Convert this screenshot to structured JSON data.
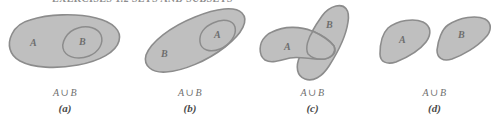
{
  "figure": {
    "heading_partial": "EXERCISES 1.2  SETS AND SUBSETS",
    "colors": {
      "blob_fill": "#bfbfbf",
      "blob_stroke": "#8c8c8c",
      "label_text": "#6e6e6e",
      "caption_text": "#6f6f6f",
      "index_text": "#4b4b4b",
      "background": "#ffffff"
    },
    "panels": [
      {
        "id": "a",
        "index_label": "(a)",
        "caption_expr": "A ∪ B",
        "caption_left": "A",
        "caption_op": "∪",
        "caption_right": "B",
        "relation": "B is a subset of A",
        "outer_set": "A",
        "inner_set": "B",
        "labels": [
          {
            "text": "A",
            "name": "set-label-a"
          },
          {
            "text": "B",
            "name": "set-label-b"
          }
        ]
      },
      {
        "id": "b",
        "index_label": "(b)",
        "caption_expr": "A ∪ B",
        "caption_left": "A",
        "caption_op": "∪",
        "caption_right": "B",
        "relation": "A is a subset of B",
        "outer_set": "B",
        "inner_set": "A",
        "labels": [
          {
            "text": "B",
            "name": "set-label-b"
          },
          {
            "text": "A",
            "name": "set-label-a"
          }
        ]
      },
      {
        "id": "c",
        "index_label": "(c)",
        "caption_expr": "A ∪ B",
        "caption_left": "A",
        "caption_op": "∪",
        "caption_right": "B",
        "relation": "A and B overlap",
        "outer_set": "",
        "inner_set": "",
        "labels": [
          {
            "text": "A",
            "name": "set-label-a"
          },
          {
            "text": "B",
            "name": "set-label-b"
          }
        ]
      },
      {
        "id": "d",
        "index_label": "(d)",
        "caption_expr": "A ∪ B",
        "caption_left": "A",
        "caption_op": "∪",
        "caption_right": "B",
        "relation": "A and B are disjoint",
        "outer_set": "",
        "inner_set": "",
        "labels": [
          {
            "text": "A",
            "name": "set-label-a"
          },
          {
            "text": "B",
            "name": "set-label-b"
          }
        ]
      }
    ]
  }
}
